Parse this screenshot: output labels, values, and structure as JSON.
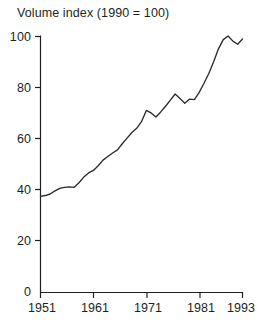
{
  "chart_data": {
    "type": "line",
    "title": "Volume index (1990 = 100)",
    "xlabel": "",
    "ylabel": "",
    "xlim": [
      1951,
      1993
    ],
    "ylim": [
      0,
      100
    ],
    "grid": false,
    "legend": "none",
    "x_ticks": [
      1951,
      1961,
      1971,
      1981,
      1993
    ],
    "x_tick_labels": [
      "1951",
      "1961",
      "1971",
      "1981",
      "1993"
    ],
    "y_ticks": [
      0,
      20,
      40,
      60,
      80,
      100
    ],
    "y_tick_labels": [
      "0",
      "20",
      "40",
      "60",
      "80",
      "100"
    ],
    "series": [
      {
        "name": "Volume index",
        "color": "#2b2b2b",
        "x": [
          1951,
          1952,
          1953,
          1954,
          1955,
          1956,
          1957,
          1958,
          1959,
          1960,
          1961,
          1962,
          1963,
          1964,
          1965,
          1966,
          1967,
          1968,
          1969,
          1970,
          1971,
          1972,
          1973,
          1974,
          1975,
          1976,
          1977,
          1978,
          1979,
          1980,
          1981,
          1982,
          1983,
          1984,
          1985,
          1986,
          1987,
          1988,
          1989,
          1990,
          1991,
          1992,
          1993
        ],
        "values": [
          37.5,
          37.8,
          38.4,
          39.6,
          40.6,
          41.0,
          41.2,
          41.0,
          42.8,
          45.0,
          46.6,
          47.6,
          49.4,
          51.6,
          53.0,
          54.4,
          55.6,
          58.0,
          60.2,
          62.4,
          64.0,
          66.6,
          71.0,
          70.0,
          68.4,
          70.4,
          72.6,
          75.0,
          77.4,
          75.6,
          73.8,
          75.4,
          75.2,
          78.0,
          81.6,
          85.4,
          90.0,
          95.0,
          98.6,
          100.0,
          98.0,
          96.8,
          98.8
        ]
      }
    ]
  },
  "axes": {
    "y_axis_name": "value-axis",
    "x_axis_name": "year-axis"
  }
}
